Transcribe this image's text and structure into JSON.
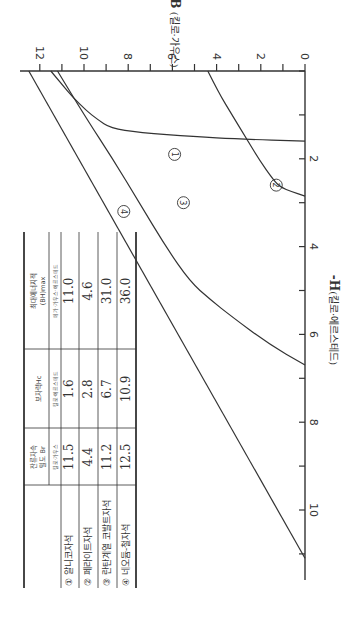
{
  "chart_data": {
    "type": "line",
    "title": "",
    "orientation_note": "figure printed rotated 90 degrees clockwise",
    "xlabel": "-H(킬로·에르스테드)",
    "ylabel": "B (킬로·가우스)",
    "xlim": [
      0,
      11.7
    ],
    "ylim": [
      0,
      12.9
    ],
    "x_ticks": [
      0,
      1,
      2,
      3,
      4,
      5,
      6,
      7,
      8,
      9,
      10,
      11
    ],
    "x_tick_labels": [
      "",
      "",
      "2",
      "",
      "4",
      "",
      "6",
      "",
      "8",
      "",
      "10",
      ""
    ],
    "y_ticks": [
      0,
      1,
      2,
      3,
      4,
      5,
      6,
      7,
      8,
      9,
      10,
      11,
      12
    ],
    "y_tick_labels": [
      "0",
      "",
      "2",
      "",
      "4",
      "",
      "6",
      "",
      "8",
      "",
      "10",
      "",
      "12"
    ],
    "grid": false,
    "series": [
      {
        "name": "① 알니코자석",
        "label": "①",
        "label_at": [
          1.9,
          5.9
        ],
        "points": [
          [
            0,
            11.5
          ],
          [
            0.3,
            11.0
          ],
          [
            0.6,
            10.5
          ],
          [
            0.9,
            9.9
          ],
          [
            1.1,
            9.4
          ],
          [
            1.3,
            8.8
          ],
          [
            1.4,
            7.5
          ],
          [
            1.5,
            5.0
          ],
          [
            1.55,
            3.0
          ],
          [
            1.6,
            0
          ]
        ]
      },
      {
        "name": "② 페라이트자석",
        "label": "②",
        "label_at": [
          2.6,
          1.3
        ],
        "points": [
          [
            0,
            4.4
          ],
          [
            0.5,
            3.9
          ],
          [
            1.0,
            3.3
          ],
          [
            1.5,
            2.7
          ],
          [
            2.0,
            2.1
          ],
          [
            2.5,
            1.4
          ],
          [
            2.65,
            1.1
          ],
          [
            2.75,
            0.6
          ],
          [
            2.85,
            0
          ]
        ]
      },
      {
        "name": "③ 란탄계열 코발트자석",
        "label": "③",
        "label_at": [
          3.0,
          5.5
        ],
        "points": [
          [
            0,
            11.2
          ],
          [
            1.0,
            10.0
          ],
          [
            2.0,
            8.7
          ],
          [
            3.0,
            7.5
          ],
          [
            4.0,
            6.3
          ],
          [
            4.8,
            5.2
          ],
          [
            5.2,
            4.3
          ],
          [
            5.6,
            3.3
          ],
          [
            6.2,
            1.7
          ],
          [
            6.7,
            0
          ]
        ]
      },
      {
        "name": "④ 네오듐-철자석",
        "label": "④",
        "label_at": [
          3.2,
          8.2
        ],
        "points": [
          [
            0,
            12.5
          ],
          [
            11.1,
            0
          ]
        ]
      }
    ],
    "table": {
      "columns": [
        "",
        "잔류자속 밀도 Br",
        "보자력Hc",
        "최대에너지적 (BH)max"
      ],
      "units": [
        "",
        "킬로·가우스",
        "킬로·에르스테드",
        "메가·가우스·에르스테드"
      ],
      "rows": [
        [
          "① 알니코자석",
          "11.5",
          "1.6",
          "11.0"
        ],
        [
          "② 페라이트자석",
          "4.4",
          "2.8",
          "4.6"
        ],
        [
          "③ 란탄계열 코발트자석",
          "11.2",
          "6.7",
          "31.0"
        ],
        [
          "④ 네오듐-철자석",
          "12.5",
          "10.9",
          "36.0"
        ]
      ]
    }
  },
  "table_view": {
    "headers": {
      "br_title_1": "잔류자속",
      "br_title_2": "밀도  Br",
      "br_unit": "킬로·가우스",
      "hc_title": "보자력Hc",
      "hc_unit": "킬로·에르스테드",
      "bh_title_1": "최대에너지적",
      "bh_title_2": "(BH)max",
      "bh_unit": "메가·가우스·에르스테드"
    },
    "rows": [
      {
        "num": "①",
        "name": "알니코자석",
        "br": "11.5",
        "hc": "1.6",
        "bh": "11.0"
      },
      {
        "num": "②",
        "name": "페라이트자석",
        "br": "4.4",
        "hc": "2.8",
        "bh": "4.6"
      },
      {
        "num": "③",
        "name": "란탄계열 코발트자석",
        "br": "11.2",
        "hc": "6.7",
        "bh": "31.0"
      },
      {
        "num": "④",
        "name": "네오듐-철자석",
        "br": "12.5",
        "hc": "10.9",
        "bh": "36.0"
      }
    ]
  },
  "axes_view": {
    "b_axis_label": "B (킬로·가우스)",
    "h_axis_label": "-H(킬로·에르스테드)"
  }
}
